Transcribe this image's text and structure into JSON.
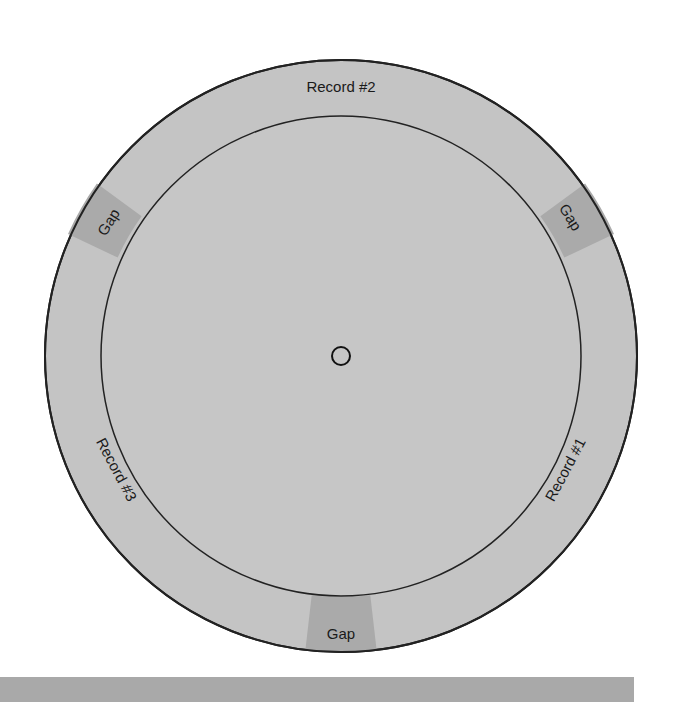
{
  "diagram": {
    "type": "disk-track-layout",
    "center_hole": "spindle-hole",
    "labels": {
      "record_1": "Record #1",
      "record_2": "Record #2",
      "record_3": "Record #3",
      "gap_top_left": "Gap",
      "gap_top_right": "Gap",
      "gap_bottom": "Gap"
    },
    "colors": {
      "track": "#c4c4c4",
      "gap": "#a9a9a9",
      "inner": "#c6c6c6",
      "outline": "#222222",
      "bar": "#a9a9a9"
    }
  }
}
